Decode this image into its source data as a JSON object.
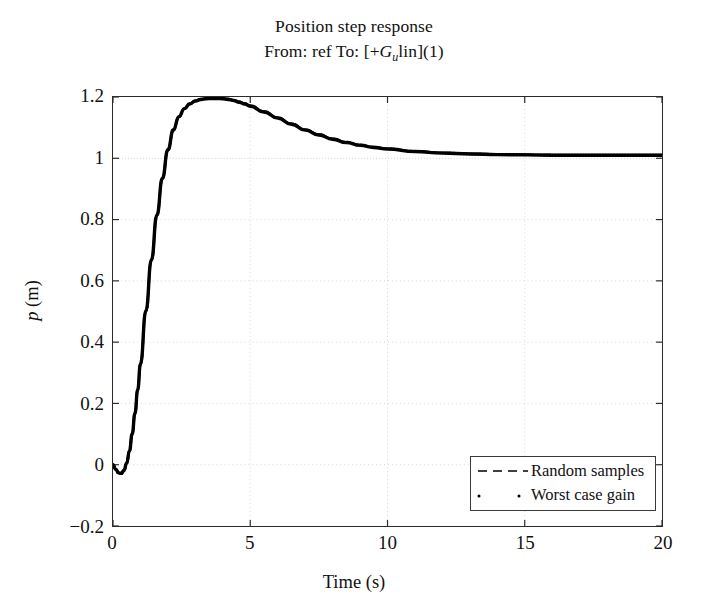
{
  "figure": {
    "title": "Position step response",
    "subtitle_parts": {
      "prefix": "From: ref To: [+",
      "symbol": "G",
      "subscript": "u",
      "middle": "lin](1)"
    },
    "subtitle_plain": "From: ref To: [+G_ulin](1)",
    "background_color": "#ffffff",
    "axis_color": "#2b2b2b",
    "curve_color": "#000000",
    "grid_color": "#cfcfcf"
  },
  "chart_data": {
    "type": "line",
    "title": "Position step response",
    "subtitle": "From: ref To: [+G_ulin](1)",
    "xlabel": "Time (s)",
    "ylabel": "p (m)",
    "xlim": [
      0,
      20
    ],
    "ylim": [
      -0.2,
      1.2
    ],
    "xticks": [
      0,
      5,
      10,
      15,
      20
    ],
    "yticks": [
      -0.2,
      0,
      0.2,
      0.4,
      0.6,
      0.8,
      1,
      1.2
    ],
    "xtick_labels": [
      "0",
      "5",
      "10",
      "15",
      "20"
    ],
    "ytick_labels": [
      "-0.2",
      "0",
      "0.2",
      "0.4",
      "0.6",
      "0.8",
      "1",
      "1.2"
    ],
    "grid": true,
    "grid_style": "dotted",
    "reference_line_y": 1,
    "legend_position": "lower right",
    "legend": [
      {
        "label": "Random samples",
        "style": "dashed"
      },
      {
        "label": "Worst case gain",
        "style": "dotted"
      }
    ],
    "series": [
      {
        "name": "Random samples",
        "style": "dashed",
        "x": [
          0.0,
          0.1,
          0.2,
          0.3,
          0.4,
          0.5,
          0.6,
          0.7,
          0.8,
          0.9,
          1.0,
          1.2,
          1.4,
          1.6,
          1.8,
          2.0,
          2.2,
          2.4,
          2.6,
          2.8,
          3.0,
          3.2,
          3.4,
          3.6,
          3.8,
          4.0,
          4.2,
          4.4,
          4.6,
          4.8,
          5.0,
          5.5,
          6.0,
          6.5,
          7.0,
          7.5,
          8.0,
          8.5,
          9.0,
          9.5,
          10.0,
          11.0,
          12.0,
          13.0,
          14.0,
          15.0,
          16.0,
          17.0,
          18.0,
          19.0,
          20.0
        ],
        "y": [
          0.0,
          -0.015,
          -0.026,
          -0.028,
          -0.018,
          0.006,
          0.046,
          0.101,
          0.168,
          0.245,
          0.329,
          0.503,
          0.669,
          0.815,
          0.935,
          1.028,
          1.093,
          1.136,
          1.162,
          1.178,
          1.187,
          1.192,
          1.194,
          1.195,
          1.195,
          1.194,
          1.192,
          1.188,
          1.183,
          1.177,
          1.17,
          1.151,
          1.131,
          1.111,
          1.092,
          1.076,
          1.062,
          1.051,
          1.042,
          1.035,
          1.03,
          1.022,
          1.017,
          1.014,
          1.012,
          1.011,
          1.01,
          1.01,
          1.01,
          1.01,
          1.01
        ]
      },
      {
        "name": "Worst case gain",
        "style": "dotted",
        "x": [
          0.0,
          0.1,
          0.2,
          0.3,
          0.4,
          0.5,
          0.6,
          0.7,
          0.8,
          0.9,
          1.0,
          1.2,
          1.4,
          1.6,
          1.8,
          2.0,
          2.2,
          2.4,
          2.6,
          2.8,
          3.0,
          3.2,
          3.4,
          3.6,
          3.8,
          4.0,
          4.2,
          4.4,
          4.6,
          4.8,
          5.0,
          5.5,
          6.0,
          6.5,
          7.0,
          7.5,
          8.0,
          8.5,
          9.0,
          9.5,
          10.0,
          11.0,
          12.0,
          13.0,
          14.0,
          15.0,
          16.0,
          17.0,
          18.0,
          19.0,
          20.0
        ],
        "y": [
          0.0,
          -0.016,
          -0.028,
          -0.03,
          -0.02,
          0.004,
          0.044,
          0.099,
          0.166,
          0.243,
          0.327,
          0.501,
          0.667,
          0.813,
          0.933,
          1.026,
          1.091,
          1.135,
          1.161,
          1.177,
          1.188,
          1.193,
          1.196,
          1.197,
          1.197,
          1.196,
          1.194,
          1.19,
          1.185,
          1.179,
          1.172,
          1.153,
          1.133,
          1.113,
          1.094,
          1.078,
          1.064,
          1.053,
          1.044,
          1.037,
          1.032,
          1.023,
          1.018,
          1.015,
          1.013,
          1.012,
          1.011,
          1.011,
          1.011,
          1.011,
          1.011
        ]
      }
    ],
    "annotations": {
      "peak_value": 1.195,
      "peak_time": 3.7,
      "undershoot_value": -0.03,
      "undershoot_time": 0.3,
      "steady_state": 1.01
    }
  },
  "axis_labels": {
    "x": "Time (s)",
    "y_parts": {
      "symbol": "p",
      "unit": "(m)"
    },
    "y_plain": "p (m)"
  },
  "legend": {
    "items": [
      {
        "label": "Random samples",
        "key": "dashed-line-key"
      },
      {
        "label": "Worst case gain",
        "key": "dotted-line-key"
      }
    ]
  }
}
